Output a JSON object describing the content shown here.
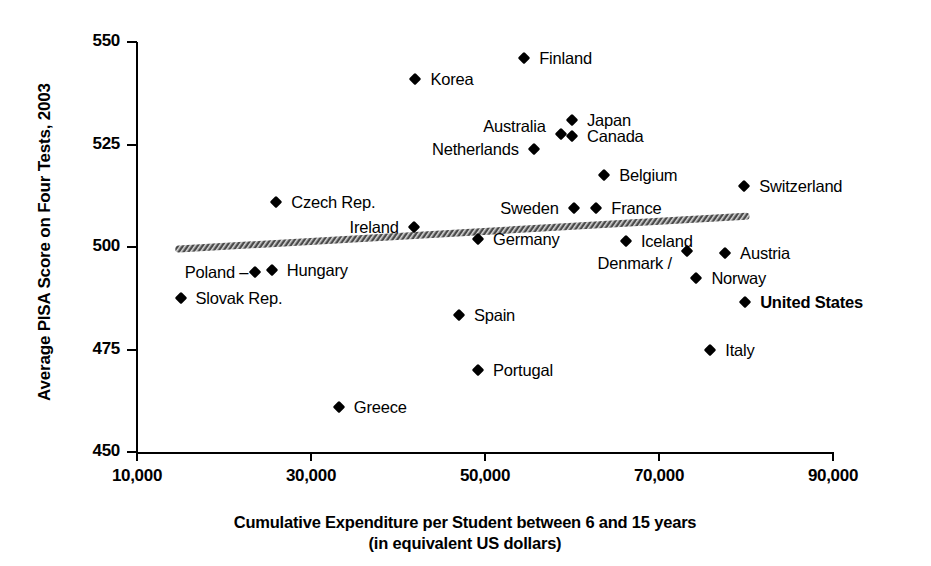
{
  "chart_data": {
    "type": "scatter",
    "title": "",
    "xlabel": "Cumulative Expenditure per Student between 6 and 15 years",
    "xlabel_line2": "(in equivalent US dollars)",
    "ylabel": "Average PISA Score on Four Tests, 2003",
    "xlim": [
      10000,
      90000
    ],
    "ylim": [
      450,
      550
    ],
    "xticks": [
      10000,
      30000,
      50000,
      70000,
      90000
    ],
    "xtick_labels": [
      "10,000",
      "30,000",
      "50,000",
      "70,000",
      "90,000"
    ],
    "yticks": [
      450,
      475,
      500,
      525,
      550
    ],
    "ytick_labels": [
      "450",
      "475",
      "500",
      "525",
      "550"
    ],
    "grid": false,
    "legend": false,
    "marker_color": "#000000",
    "axis_color": "#000000",
    "points": [
      {
        "label": "Finland",
        "x": 54500,
        "y": 546.0,
        "label_pos": "right",
        "bold": false
      },
      {
        "label": "Korea",
        "x": 42000,
        "y": 541.0,
        "label_pos": "right",
        "bold": false
      },
      {
        "label": "Japan",
        "x": 60000,
        "y": 531.0,
        "label_pos": "right",
        "bold": false
      },
      {
        "label": "Canada",
        "x": 60000,
        "y": 527.0,
        "label_pos": "right",
        "bold": false
      },
      {
        "label": "Australia",
        "x": 58700,
        "y": 527.5,
        "label_pos": "above-left",
        "bold": false
      },
      {
        "label": "Netherlands",
        "x": 55600,
        "y": 524.0,
        "label_pos": "left",
        "bold": false
      },
      {
        "label": "Belgium",
        "x": 63700,
        "y": 517.5,
        "label_pos": "right",
        "bold": false
      },
      {
        "label": "Switzerland",
        "x": 79800,
        "y": 515.0,
        "label_pos": "right",
        "bold": false
      },
      {
        "label": "Czech Rep.",
        "x": 26000,
        "y": 511.0,
        "label_pos": "right",
        "bold": false
      },
      {
        "label": "Sweden",
        "x": 60200,
        "y": 509.5,
        "label_pos": "left",
        "bold": false
      },
      {
        "label": "France",
        "x": 62800,
        "y": 509.5,
        "label_pos": "right",
        "bold": false
      },
      {
        "label": "Ireland",
        "x": 41800,
        "y": 505.0,
        "label_pos": "left",
        "bold": false
      },
      {
        "label": "Germany",
        "x": 49200,
        "y": 502.0,
        "label_pos": "right",
        "bold": false
      },
      {
        "label": "Iceland",
        "x": 66200,
        "y": 501.5,
        "label_pos": "right",
        "bold": false
      },
      {
        "label": "Denmark /",
        "x": 73200,
        "y": 499.0,
        "label_pos": "below-left",
        "bold": false
      },
      {
        "label": "Austria",
        "x": 77600,
        "y": 498.5,
        "label_pos": "right",
        "bold": false
      },
      {
        "label": "Norway",
        "x": 74300,
        "y": 492.5,
        "label_pos": "right",
        "bold": false
      },
      {
        "label": "Hungary",
        "x": 25500,
        "y": 494.5,
        "label_pos": "right",
        "bold": false
      },
      {
        "label": "Poland",
        "x": 23600,
        "y": 494.0,
        "label_pos": "dash-left",
        "bold": false
      },
      {
        "label": "United States",
        "x": 79900,
        "y": 486.5,
        "label_pos": "right",
        "bold": true
      },
      {
        "label": "Slovak Rep.",
        "x": 15000,
        "y": 487.5,
        "label_pos": "right",
        "bold": false
      },
      {
        "label": "Spain",
        "x": 47000,
        "y": 483.5,
        "label_pos": "right",
        "bold": false
      },
      {
        "label": "Italy",
        "x": 75900,
        "y": 475.0,
        "label_pos": "right",
        "bold": false
      },
      {
        "label": "Portugal",
        "x": 49200,
        "y": 470.0,
        "label_pos": "right",
        "bold": false
      },
      {
        "label": "Greece",
        "x": 33200,
        "y": 461.0,
        "label_pos": "right",
        "bold": false
      }
    ],
    "trendline": {
      "x_start": 14800,
      "y_start": 499.5,
      "x_end": 80000,
      "y_end": 507.5,
      "style": "thick-textured",
      "color": "#555555"
    }
  }
}
